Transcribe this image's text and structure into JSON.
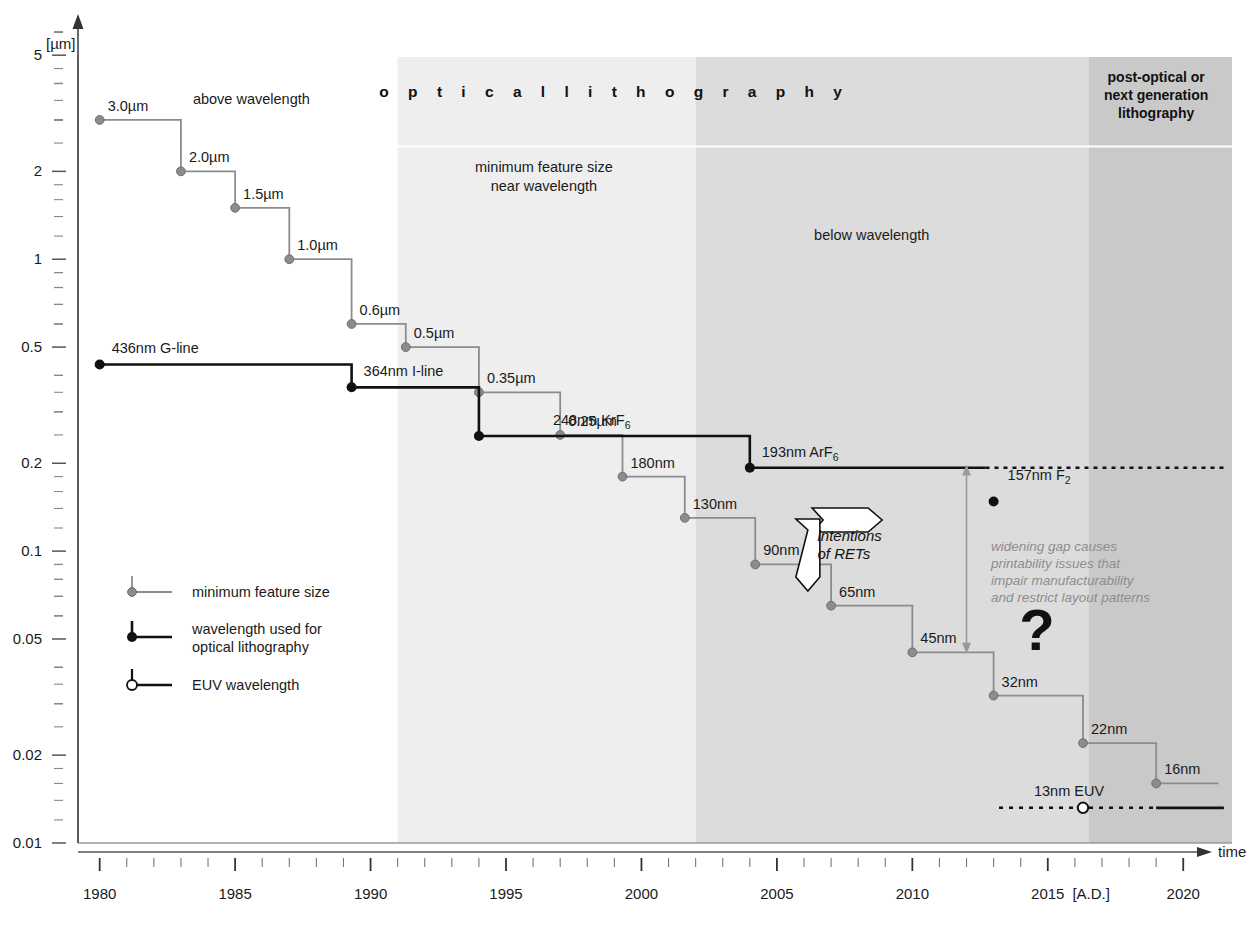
{
  "chart_data": {
    "type": "line",
    "title": "",
    "xlabel": "time",
    "ylabel": "[µm]",
    "x_unit_note": "[A.D.]",
    "xlim": [
      1979.2,
      2021.8
    ],
    "ylim": [
      0.01,
      6.6
    ],
    "yscale": "log",
    "xscale": "linear",
    "grid": false,
    "y_major_ticks": [
      "5",
      "2",
      "1",
      "0.5",
      "0.2",
      "0.1",
      "0.05",
      "0.02",
      "0.01"
    ],
    "y_major_values": [
      5,
      2,
      1,
      0.5,
      0.2,
      0.1,
      0.05,
      0.02,
      0.01
    ],
    "x_major_ticks": [
      "1980",
      "1985",
      "1990",
      "1995",
      "2000",
      "2005",
      "2010",
      "2015",
      "2020"
    ],
    "series": [
      {
        "name": "minimum feature size",
        "style": "step-gray",
        "color": "#8c8c8c",
        "points": [
          {
            "label": "3.0µm",
            "x": 1980.0,
            "y": 3.0,
            "x_end": 1983.0
          },
          {
            "label": "2.0µm",
            "x": 1983.0,
            "y": 2.0,
            "x_end": 1985.0
          },
          {
            "label": "1.5µm",
            "x": 1985.0,
            "y": 1.5,
            "x_end": 1987.0
          },
          {
            "label": "1.0µm",
            "x": 1987.0,
            "y": 1.0,
            "x_end": 1989.3
          },
          {
            "label": "0.6µm",
            "x": 1989.3,
            "y": 0.6,
            "x_end": 1991.3
          },
          {
            "label": "0.5µm",
            "x": 1991.3,
            "y": 0.5,
            "x_end": 1994.0
          },
          {
            "label": "0.35µm",
            "x": 1994.0,
            "y": 0.35,
            "x_end": 1997.0
          },
          {
            "label": "0.25µm",
            "x": 1997.0,
            "y": 0.25,
            "x_end": 1999.3
          },
          {
            "label": "180nm",
            "x": 1999.3,
            "y": 0.18,
            "x_end": 2001.6
          },
          {
            "label": "130nm",
            "x": 2001.6,
            "y": 0.13,
            "x_end": 2004.2
          },
          {
            "label": "90nm",
            "x": 2004.2,
            "y": 0.09,
            "x_end": 2007.0
          },
          {
            "label": "65nm",
            "x": 2007.0,
            "y": 0.065,
            "x_end": 2010.0
          },
          {
            "label": "45nm",
            "x": 2010.0,
            "y": 0.045,
            "x_end": 2013.0
          },
          {
            "label": "32nm",
            "x": 2013.0,
            "y": 0.032,
            "x_end": 2016.3
          },
          {
            "label": "22nm",
            "x": 2016.3,
            "y": 0.022,
            "x_end": 2019.0
          },
          {
            "label": "16nm",
            "x": 2019.0,
            "y": 0.016,
            "x_end": 2021.3
          }
        ]
      },
      {
        "name": "wavelength used for optical lithography",
        "style": "step-black",
        "color": "#111111",
        "points": [
          {
            "label": "436nm G-line",
            "x": 1980.0,
            "y": 0.436,
            "x_end": 1989.3
          },
          {
            "label": "364nm I-line",
            "x": 1989.3,
            "y": 0.364,
            "x_end": 1994.0
          },
          {
            "label": "248nm KrF",
            "label_sub": "6",
            "x": 1994.0,
            "y": 0.248,
            "x_end": 1997.0
          },
          {
            "label": "0.25µm",
            "x": 1997.0,
            "y": 0.248,
            "x_end": 1997.0
          },
          {
            "label": "193nm ArF",
            "label_sub": "6",
            "x": 2004.0,
            "y": 0.193,
            "x_end": 2012.7,
            "dotted_to": 2021.5
          }
        ]
      },
      {
        "name": "157nm F2 point",
        "style": "point-black",
        "label": "157nm F",
        "label_sub": "2",
        "x": 2013.0,
        "y": 0.157
      },
      {
        "name": "EUV wavelength",
        "style": "euv",
        "label": "13nm EUV",
        "x": 2016.3,
        "y": 0.0132,
        "dotted_from": 2013.2,
        "dotted_to": 2019.0,
        "solid_to": 2021.5
      }
    ],
    "bands": [
      {
        "name": "above-wavelength",
        "x0": 1980.0,
        "x1": 1991.0,
        "fill": "#ffffff",
        "label": "above wavelength",
        "label_x": 1985.4,
        "label_y_px": 104
      },
      {
        "name": "near-wavelength",
        "x0": 1991.0,
        "x1": 2002.0,
        "fill": "#eeeeee",
        "label": "minimum feature size\nnear wavelength"
      },
      {
        "name": "below-wavelength",
        "x0": 2002.0,
        "x1": 2016.5,
        "fill": "#dcdcdc",
        "label": "below wavelength"
      },
      {
        "name": "post-optical",
        "x0": 2016.5,
        "x1": 2021.8,
        "fill": "#c9c9c9",
        "label": "post-optical or next generation lithography"
      }
    ],
    "annotations": [
      {
        "name": "optical-lithography-header",
        "text": "o p t i c a l   l i t h o g r a p h y"
      },
      {
        "name": "above-wavelength-label",
        "text": "above wavelength"
      },
      {
        "name": "near-wavelength-label-line1",
        "text": "minimum feature size"
      },
      {
        "name": "near-wavelength-label-line2",
        "text": "near wavelength"
      },
      {
        "name": "below-wavelength-label",
        "text": "below wavelength"
      },
      {
        "name": "post-optical-label-line1",
        "text": "post-optical or"
      },
      {
        "name": "post-optical-label-line2",
        "text": "next generation"
      },
      {
        "name": "post-optical-label-line3",
        "text": "lithography"
      },
      {
        "name": "intentions-of-rets-line1",
        "text": "intentions"
      },
      {
        "name": "intentions-of-rets-line2",
        "text": "of RETs"
      },
      {
        "name": "widening-gap-line1",
        "text": "widening gap causes"
      },
      {
        "name": "widening-gap-line2",
        "text": "printability issues that"
      },
      {
        "name": "widening-gap-line3",
        "text": "impair manufacturability"
      },
      {
        "name": "widening-gap-line4",
        "text": "and restrict layout patterns"
      },
      {
        "name": "question-mark",
        "text": "?"
      }
    ]
  },
  "legend": {
    "position": "lower-left",
    "items": [
      {
        "key": "minimum-feature-size",
        "label": "minimum feature size",
        "color": "#8c8c8c",
        "marker": "filled-gray-circle"
      },
      {
        "key": "optical-wavelength",
        "label_line1": "wavelength used for",
        "label_line2": "optical lithography",
        "color": "#111111",
        "marker": "filled-black-circle"
      },
      {
        "key": "euv-wavelength",
        "label": "EUV wavelength",
        "color": "#111111",
        "marker": "open-circle"
      }
    ]
  },
  "axis": {
    "y_unit": "[µm]",
    "x_arrow_label": "time",
    "x_era_label": "[A.D.]"
  },
  "colors": {
    "feature_line": "#8c8c8c",
    "wavelength_line": "#111111",
    "band_near": "#eeeeee",
    "band_below": "#dcdcdc",
    "band_post": "#c9c9c9",
    "gap_text": "#8d8d8d",
    "axis": "#777777"
  }
}
